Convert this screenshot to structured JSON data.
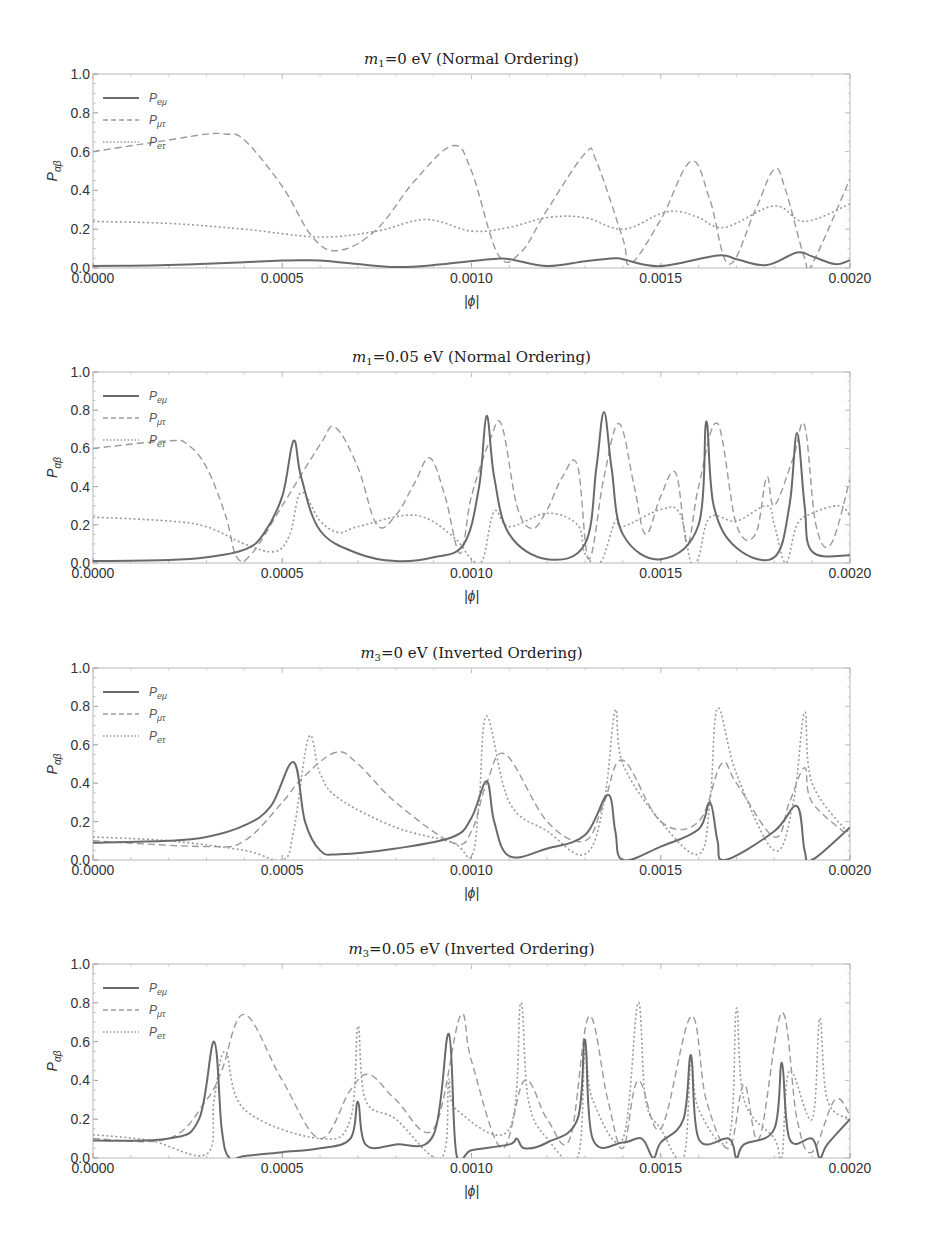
{
  "figure": {
    "width": 927,
    "height": 1236,
    "xlabel": "|ϕ|",
    "ylabel_main": "P",
    "ylabel_sub": "αβ",
    "series_style": {
      "P_emu": {
        "label_main": "P",
        "label_sub": "eμ",
        "color": "#6a6a6a",
        "dash": "",
        "width": 2
      },
      "P_mutau": {
        "label_main": "P",
        "label_sub": "μτ",
        "color": "#9a9a9a",
        "dash": "7,4",
        "width": 1.4
      },
      "P_etau": {
        "label_main": "P",
        "label_sub": "eτ",
        "color": "#9a9a9a",
        "dash": "2,2.5",
        "width": 1.6
      }
    }
  },
  "chart_data": [
    {
      "type": "line",
      "title": "m1=0 eV (Normal Ordering)",
      "title_mass": "m",
      "title_mass_sub": "1",
      "title_rest": "=0 eV (Normal Ordering)",
      "xlabel": "|ϕ|",
      "ylabel": "P_αβ",
      "xlim": [
        0,
        0.002
      ],
      "ylim": [
        0,
        1
      ],
      "xticks": [
        "0.0000",
        "0.0005",
        "0.0010",
        "0.0015",
        "0.0020"
      ],
      "yticks": [
        "0.0",
        "0.2",
        "0.4",
        "0.6",
        "0.8",
        "1.0"
      ],
      "legend": [
        "P_eμ",
        "P_μτ",
        "P_eτ"
      ],
      "legend_position": "upper-left",
      "grid": false,
      "box": {
        "left": 93,
        "right": 850,
        "top": 74,
        "bottom": 268
      },
      "series": [
        {
          "name": "P_emu",
          "x": [
            0,
            0.0001,
            0.0002,
            0.0003,
            0.0004,
            0.0005,
            0.00055,
            0.0006,
            0.0007,
            0.0008,
            0.0009,
            0.00105,
            0.0011,
            0.0012,
            0.0013,
            0.00138,
            0.0014,
            0.0015,
            0.00165,
            0.0017,
            0.00178,
            0.00186,
            0.0019,
            0.00196,
            0.002
          ],
          "y": [
            0.01,
            0.012,
            0.015,
            0.022,
            0.03,
            0.038,
            0.04,
            0.038,
            0.02,
            0.005,
            0.015,
            0.045,
            0.045,
            0.01,
            0.035,
            0.05,
            0.045,
            0.01,
            0.065,
            0.045,
            0.015,
            0.08,
            0.06,
            0.02,
            0.04
          ]
        },
        {
          "name": "P_mutau",
          "x": [
            0,
            0.0001,
            0.0002,
            0.0003,
            0.00035,
            0.0004,
            0.0005,
            0.00058,
            0.00065,
            0.00075,
            0.00085,
            0.00095,
            0.001,
            0.00107,
            0.00113,
            0.0012,
            0.0013,
            0.00133,
            0.0014,
            0.00142,
            0.0015,
            0.00158,
            0.00163,
            0.00168,
            0.00175,
            0.0018,
            0.00183,
            0.00188,
            0.0019,
            0.002
          ],
          "y": [
            0.6,
            0.63,
            0.66,
            0.69,
            0.69,
            0.66,
            0.42,
            0.16,
            0.09,
            0.2,
            0.45,
            0.63,
            0.5,
            0.07,
            0.08,
            0.3,
            0.59,
            0.55,
            0.15,
            0.02,
            0.25,
            0.55,
            0.35,
            0.02,
            0.3,
            0.51,
            0.4,
            0.05,
            0.02,
            0.46
          ]
        },
        {
          "name": "P_etau",
          "x": [
            0,
            0.0002,
            0.0004,
            0.0006,
            0.00075,
            0.00088,
            0.001,
            0.0011,
            0.0012,
            0.0013,
            0.0014,
            0.0015,
            0.00155,
            0.0016,
            0.00167,
            0.0018,
            0.00188,
            0.002
          ],
          "y": [
            0.24,
            0.23,
            0.2,
            0.16,
            0.19,
            0.25,
            0.19,
            0.21,
            0.26,
            0.26,
            0.2,
            0.28,
            0.29,
            0.26,
            0.21,
            0.32,
            0.24,
            0.33
          ]
        }
      ]
    },
    {
      "type": "line",
      "title": "m1=0.05 eV (Normal Ordering)",
      "title_mass": "m",
      "title_mass_sub": "1",
      "title_rest": "=0.05 eV (Normal Ordering)",
      "xlabel": "|ϕ|",
      "ylabel": "P_αβ",
      "xlim": [
        0,
        0.002
      ],
      "ylim": [
        0,
        1
      ],
      "xticks": [
        "0.0000",
        "0.0005",
        "0.0010",
        "0.0015",
        "0.0020"
      ],
      "yticks": [
        "0.0",
        "0.2",
        "0.4",
        "0.6",
        "0.8",
        "1.0"
      ],
      "legend": [
        "P_eμ",
        "P_μτ",
        "P_eτ"
      ],
      "legend_position": "upper-left",
      "grid": false,
      "box": {
        "left": 93,
        "right": 850,
        "top": 372,
        "bottom": 563
      },
      "series": [
        {
          "name": "P_emu",
          "x": [
            0,
            0.0002,
            0.0003,
            0.0004,
            0.00045,
            0.0005,
            0.00053,
            0.00055,
            0.0006,
            0.0007,
            0.0008,
            0.0009,
            0.00098,
            0.00102,
            0.00104,
            0.00106,
            0.0011,
            0.0012,
            0.0013,
            0.00133,
            0.00135,
            0.00137,
            0.0014,
            0.0015,
            0.0016,
            0.00162,
            0.00164,
            0.0017,
            0.0018,
            0.00184,
            0.00186,
            0.00188,
            0.0019,
            0.002
          ],
          "y": [
            0.01,
            0.015,
            0.03,
            0.07,
            0.15,
            0.35,
            0.64,
            0.45,
            0.17,
            0.05,
            0.01,
            0.03,
            0.1,
            0.4,
            0.77,
            0.45,
            0.15,
            0.02,
            0.1,
            0.5,
            0.79,
            0.5,
            0.15,
            0.02,
            0.2,
            0.74,
            0.3,
            0.08,
            0.03,
            0.3,
            0.68,
            0.3,
            0.06,
            0.04
          ]
        },
        {
          "name": "P_mutau",
          "x": [
            0,
            0.0002,
            0.00025,
            0.0003,
            0.00035,
            0.00038,
            0.00042,
            0.0005,
            0.0006,
            0.00064,
            0.0007,
            0.00075,
            0.0008,
            0.00085,
            0.00089,
            0.00093,
            0.00097,
            0.001,
            0.00105,
            0.00108,
            0.00112,
            0.00116,
            0.0012,
            0.00124,
            0.00128,
            0.00131,
            0.00135,
            0.00139,
            0.00143,
            0.00146,
            0.0015,
            0.00154,
            0.00157,
            0.0016,
            0.00165,
            0.0017,
            0.00175,
            0.00178,
            0.0018,
            0.00185,
            0.00188,
            0.00191,
            0.00195,
            0.002
          ],
          "y": [
            0.6,
            0.64,
            0.62,
            0.5,
            0.25,
            0.03,
            0.05,
            0.3,
            0.62,
            0.71,
            0.5,
            0.2,
            0.25,
            0.42,
            0.55,
            0.35,
            0.05,
            0.35,
            0.65,
            0.72,
            0.3,
            0.18,
            0.28,
            0.45,
            0.51,
            0.02,
            0.45,
            0.73,
            0.4,
            0.15,
            0.35,
            0.47,
            0.1,
            0.4,
            0.73,
            0.2,
            0.15,
            0.45,
            0.3,
            0.55,
            0.72,
            0.2,
            0.1,
            0.44
          ]
        },
        {
          "name": "P_etau",
          "x": [
            0,
            0.0002,
            0.0003,
            0.0004,
            0.00048,
            0.00052,
            0.00055,
            0.0006,
            0.00065,
            0.0007,
            0.00085,
            0.00095,
            0.001,
            0.00103,
            0.00106,
            0.0011,
            0.0012,
            0.00128,
            0.0013,
            0.00134,
            0.00138,
            0.0014,
            0.0015,
            0.00155,
            0.00158,
            0.0016,
            0.00163,
            0.0017,
            0.00178,
            0.0018,
            0.00183,
            0.00186,
            0.0019,
            0.00197,
            0.002
          ],
          "y": [
            0.24,
            0.22,
            0.19,
            0.1,
            0.06,
            0.15,
            0.37,
            0.22,
            0.16,
            0.19,
            0.25,
            0.14,
            0.02,
            0.02,
            0.27,
            0.19,
            0.26,
            0.2,
            0.05,
            0.0,
            0.22,
            0.19,
            0.28,
            0.26,
            0.0,
            0.03,
            0.24,
            0.22,
            0.3,
            0.2,
            0.0,
            0.2,
            0.26,
            0.3,
            0.25
          ]
        }
      ]
    },
    {
      "type": "line",
      "title": "m3=0 eV (Inverted Ordering)",
      "title_mass": "m",
      "title_mass_sub": "3",
      "title_rest": "=0 eV (Inverted Ordering)",
      "xlabel": "|ϕ|",
      "ylabel": "P_αβ",
      "xlim": [
        0,
        0.002
      ],
      "ylim": [
        0,
        1
      ],
      "xticks": [
        "0.0000",
        "0.0005",
        "0.0010",
        "0.0015",
        "0.0020"
      ],
      "yticks": [
        "0.0",
        "0.2",
        "0.4",
        "0.6",
        "0.8",
        "1.0"
      ],
      "legend": [
        "P_eμ",
        "P_μτ",
        "P_eτ"
      ],
      "legend_position": "upper-left",
      "grid": false,
      "box": {
        "left": 93,
        "right": 850,
        "top": 668,
        "bottom": 860
      },
      "series": [
        {
          "name": "P_emu",
          "x": [
            0,
            0.0002,
            0.0003,
            0.0004,
            0.00047,
            0.00053,
            0.00056,
            0.0006,
            0.00065,
            0.0008,
            0.00095,
            0.001,
            0.00104,
            0.00106,
            0.0011,
            0.0012,
            0.0013,
            0.00136,
            0.00138,
            0.0014,
            0.0015,
            0.0016,
            0.00163,
            0.00165,
            0.00167,
            0.0018,
            0.00186,
            0.00188,
            0.0019,
            0.002
          ],
          "y": [
            0.09,
            0.1,
            0.12,
            0.18,
            0.28,
            0.51,
            0.2,
            0.05,
            0.03,
            0.06,
            0.12,
            0.22,
            0.41,
            0.2,
            0.02,
            0.06,
            0.13,
            0.34,
            0.15,
            0.0,
            0.07,
            0.16,
            0.3,
            0.1,
            0.0,
            0.15,
            0.28,
            0.05,
            0.0,
            0.17
          ]
        },
        {
          "name": "P_mutau",
          "x": [
            0,
            0.0003,
            0.0004,
            0.0005,
            0.00055,
            0.00064,
            0.0007,
            0.0008,
            0.00095,
            0.001,
            0.00104,
            0.00109,
            0.0012,
            0.0013,
            0.00135,
            0.0014,
            0.0015,
            0.0016,
            0.00166,
            0.0017,
            0.0018,
            0.00184,
            0.00188,
            0.0019,
            0.002
          ],
          "y": [
            0.1,
            0.07,
            0.1,
            0.3,
            0.42,
            0.56,
            0.5,
            0.3,
            0.09,
            0.15,
            0.4,
            0.55,
            0.2,
            0.1,
            0.3,
            0.52,
            0.2,
            0.2,
            0.5,
            0.4,
            0.12,
            0.3,
            0.48,
            0.3,
            0.12
          ]
        },
        {
          "name": "P_etau",
          "x": [
            0,
            0.0002,
            0.0004,
            0.0005,
            0.00053,
            0.00057,
            0.0006,
            0.00065,
            0.0008,
            0.00095,
            0.001,
            0.00102,
            0.00104,
            0.0011,
            0.0012,
            0.0013,
            0.00135,
            0.00138,
            0.0014,
            0.0015,
            0.0016,
            0.00163,
            0.00165,
            0.0017,
            0.0018,
            0.00185,
            0.00188,
            0.0019,
            0.002
          ],
          "y": [
            0.12,
            0.1,
            0.05,
            0.0,
            0.15,
            0.64,
            0.45,
            0.32,
            0.17,
            0.09,
            0.02,
            0.3,
            0.75,
            0.3,
            0.15,
            0.03,
            0.3,
            0.78,
            0.5,
            0.2,
            0.03,
            0.3,
            0.79,
            0.45,
            0.05,
            0.3,
            0.77,
            0.4,
            0.13
          ]
        }
      ]
    },
    {
      "type": "line",
      "title": "m3=0.05 eV (Inverted Ordering)",
      "title_mass": "m",
      "title_mass_sub": "3",
      "title_rest": "=0.05 eV (Inverted Ordering)",
      "xlabel": "|ϕ|",
      "ylabel": "P_αβ",
      "xlim": [
        0,
        0.002
      ],
      "ylim": [
        0,
        1
      ],
      "xticks": [
        "0.0000",
        "0.0005",
        "0.0010",
        "0.0015",
        "0.0020"
      ],
      "yticks": [
        "0.0",
        "0.2",
        "0.4",
        "0.6",
        "0.8",
        "1.0"
      ],
      "legend": [
        "P_eμ",
        "P_μτ",
        "P_eτ"
      ],
      "legend_position": "upper-left",
      "grid": false,
      "box": {
        "left": 93,
        "right": 850,
        "top": 964,
        "bottom": 1158
      },
      "series": [
        {
          "name": "P_emu",
          "x": [
            0,
            0.0002,
            0.00028,
            0.00032,
            0.00034,
            0.00036,
            0.0004,
            0.0005,
            0.0006,
            0.00068,
            0.0007,
            0.00072,
            0.0008,
            0.0009,
            0.00094,
            0.00096,
            0.001,
            0.0011,
            0.00112,
            0.00114,
            0.0012,
            0.00128,
            0.0013,
            0.00132,
            0.0014,
            0.00145,
            0.00148,
            0.0015,
            0.00156,
            0.00158,
            0.0016,
            0.00168,
            0.0017,
            0.00172,
            0.0018,
            0.00182,
            0.00184,
            0.0019,
            0.00192,
            0.00194,
            0.002
          ],
          "y": [
            0.09,
            0.1,
            0.2,
            0.6,
            0.15,
            0.0,
            0.01,
            0.03,
            0.05,
            0.1,
            0.29,
            0.07,
            0.07,
            0.12,
            0.64,
            0.02,
            0.04,
            0.07,
            0.1,
            0.05,
            0.08,
            0.2,
            0.61,
            0.1,
            0.08,
            0.1,
            0.0,
            0.08,
            0.2,
            0.53,
            0.1,
            0.1,
            0.0,
            0.07,
            0.15,
            0.49,
            0.1,
            0.1,
            0.0,
            0.07,
            0.2
          ]
        },
        {
          "name": "P_mutau",
          "x": [
            0,
            0.0002,
            0.0003,
            0.00034,
            0.0004,
            0.0005,
            0.0006,
            0.00068,
            0.00073,
            0.0008,
            0.0009,
            0.00097,
            0.001,
            0.00108,
            0.00114,
            0.0012,
            0.00126,
            0.00131,
            0.00136,
            0.0014,
            0.00144,
            0.0015,
            0.00158,
            0.00162,
            0.00168,
            0.00172,
            0.00176,
            0.00182,
            0.00186,
            0.0019,
            0.00196,
            0.002
          ],
          "y": [
            0.1,
            0.1,
            0.3,
            0.45,
            0.74,
            0.4,
            0.1,
            0.35,
            0.43,
            0.3,
            0.15,
            0.73,
            0.5,
            0.05,
            0.4,
            0.2,
            0.1,
            0.73,
            0.3,
            0.05,
            0.4,
            0.15,
            0.73,
            0.3,
            0.05,
            0.38,
            0.1,
            0.75,
            0.2,
            0.03,
            0.3,
            0.22
          ]
        },
        {
          "name": "P_etau",
          "x": [
            0,
            0.00015,
            0.0003,
            0.00032,
            0.00035,
            0.0004,
            0.0006,
            0.00068,
            0.0007,
            0.00072,
            0.0008,
            0.00092,
            0.00094,
            0.00096,
            0.0011,
            0.00113,
            0.00115,
            0.0012,
            0.00128,
            0.0013,
            0.00132,
            0.0014,
            0.00144,
            0.00146,
            0.0015,
            0.00156,
            0.00158,
            0.0016,
            0.00168,
            0.0017,
            0.00172,
            0.0018,
            0.00182,
            0.00184,
            0.0019,
            0.00192,
            0.00194,
            0.002
          ],
          "y": [
            0.12,
            0.09,
            0.02,
            0.3,
            0.55,
            0.25,
            0.1,
            0.2,
            0.68,
            0.3,
            0.2,
            0.0,
            0.4,
            0.25,
            0.15,
            0.8,
            0.3,
            0.1,
            0.0,
            0.55,
            0.3,
            0.1,
            0.8,
            0.3,
            0.15,
            0.0,
            0.5,
            0.25,
            0.1,
            0.77,
            0.3,
            0.1,
            0.0,
            0.45,
            0.2,
            0.72,
            0.3,
            0.2
          ]
        }
      ]
    }
  ]
}
